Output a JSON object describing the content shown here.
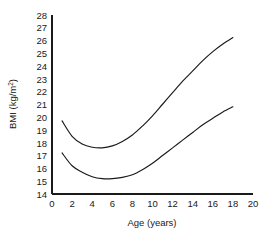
{
  "chart_data": {
    "type": "line",
    "title": "",
    "xlabel": "Age (years)",
    "ylabel": "BMI (kg/m2)",
    "ylabel_display": "BMI (kg/m",
    "ylabel_sup": "2",
    "ylabel_tail": ")",
    "xlim": [
      0,
      20
    ],
    "ylim": [
      14,
      28
    ],
    "grid": false,
    "legend": "none",
    "xticks": [
      0,
      2,
      4,
      6,
      8,
      10,
      12,
      14,
      16,
      18,
      20
    ],
    "xtick_labels": [
      "0",
      "2",
      "4",
      "6",
      "8",
      "10",
      "12",
      "14",
      "16",
      "18",
      "20"
    ],
    "yticks": [
      14,
      15,
      16,
      17,
      18,
      19,
      20,
      21,
      22,
      23,
      24,
      25,
      26,
      27,
      28
    ],
    "ytick_labels": [
      "14",
      "15",
      "16",
      "17",
      "18",
      "19",
      "20",
      "21",
      "22",
      "23",
      "24",
      "25",
      "26",
      "27",
      "28"
    ],
    "x": [
      1,
      2,
      3,
      4,
      5,
      6,
      7,
      8,
      9,
      10,
      11,
      12,
      13,
      14,
      15,
      16,
      17,
      18
    ],
    "series": [
      {
        "name": "upper-centile-curve",
        "color": "#1a1a1a",
        "values": [
          19.7,
          18.5,
          17.9,
          17.65,
          17.6,
          17.75,
          18.1,
          18.6,
          19.3,
          20.1,
          21.0,
          21.9,
          22.8,
          23.6,
          24.4,
          25.1,
          25.7,
          26.2
        ]
      },
      {
        "name": "lower-centile-curve",
        "color": "#1a1a1a",
        "values": [
          17.2,
          16.2,
          15.7,
          15.35,
          15.2,
          15.2,
          15.3,
          15.5,
          15.9,
          16.4,
          17.0,
          17.6,
          18.2,
          18.8,
          19.4,
          19.9,
          20.4,
          20.8
        ]
      }
    ],
    "annotations": []
  },
  "figure": {
    "background_color": "#ffffff",
    "axis_color": "#1a1a1a",
    "text_color": "#1a1a1a"
  }
}
